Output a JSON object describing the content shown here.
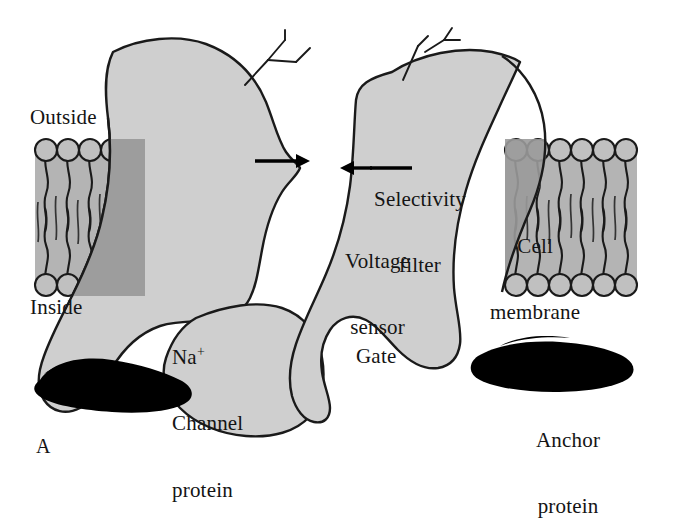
{
  "figure": {
    "panel_label": "A",
    "background_color": "#ffffff"
  },
  "colors": {
    "membrane_fill": "#b4b4b4",
    "protein_fill": "#cfcfcf",
    "protein_over_membrane_fill": "#9a9a9a",
    "outline": "#1a1a1a",
    "anchor_protein_fill": "#000000",
    "lipid_head_fill": "#c0c0c0",
    "text_color": "#141414"
  },
  "labels": {
    "outside": "Outside",
    "inside": "Inside",
    "na_channel_line1": "Na",
    "na_channel_charge": "+",
    "na_channel_line2": "Channel",
    "na_channel_line3": "protein",
    "selectivity_line1": "Selectivity",
    "selectivity_line2": "filter",
    "voltage_line1": "Voltage",
    "voltage_line2": "sensor",
    "cell_membrane_line1": "Cell",
    "cell_membrane_line2": "membrane",
    "gate": "Gate",
    "anchor_line1": "Anchor",
    "anchor_line2": "protein"
  },
  "structures": {
    "membrane_left": {
      "name": "lipid-bilayer-left",
      "x_start": 35,
      "x_end": 145,
      "top_y": 139,
      "bottom_y": 296,
      "lipid_count": 5
    },
    "membrane_right": {
      "name": "lipid-bilayer-right",
      "x_start": 505,
      "x_end": 637,
      "top_y": 139,
      "bottom_y": 296,
      "lipid_count": 6
    },
    "channel_protein": {
      "name": "sodium-channel-protein",
      "description": "Two large lobes forming a pore with a narrow selectivity filter at the top center and a gate below"
    },
    "pore_arrows": {
      "left_arrow": "arrow pointing right toward pore",
      "right_arrow": "arrow pointing left toward pore",
      "target_y": 162
    },
    "glycosylation_chains": 2,
    "anchor_proteins": 2
  }
}
